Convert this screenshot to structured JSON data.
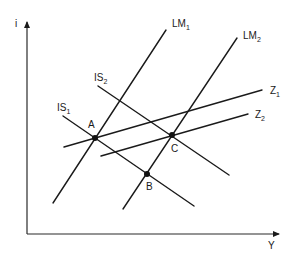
{
  "diagram": {
    "axes": {
      "y_label": "i",
      "x_label": "Y"
    },
    "curves": [
      {
        "id": "LM1",
        "label": "LM",
        "sub": "1",
        "x1": 53,
        "y1": 203,
        "x2": 166,
        "y2": 30,
        "lx": 172,
        "ly": 27
      },
      {
        "id": "LM2",
        "label": "LM",
        "sub": "2",
        "x1": 123,
        "y1": 209,
        "x2": 237,
        "y2": 38,
        "lx": 243,
        "ly": 39
      },
      {
        "id": "IS1",
        "label": "IS",
        "sub": "1",
        "x1": 63,
        "y1": 116,
        "x2": 194,
        "y2": 206,
        "lx": 57,
        "ly": 111
      },
      {
        "id": "IS2",
        "label": "IS",
        "sub": "2",
        "x1": 98,
        "y1": 86,
        "x2": 229,
        "y2": 175,
        "lx": 94,
        "ly": 81
      },
      {
        "id": "Z1",
        "label": "Z",
        "sub": "1",
        "x1": 64,
        "y1": 147,
        "x2": 262,
        "y2": 90,
        "lx": 270,
        "ly": 94
      },
      {
        "id": "Z2",
        "label": "Z",
        "sub": "2",
        "x1": 101,
        "y1": 156,
        "x2": 248,
        "y2": 114,
        "lx": 255,
        "ly": 118
      }
    ],
    "points": [
      {
        "id": "A",
        "label": "A",
        "x": 95,
        "y": 138,
        "lx": 88,
        "ly": 128
      },
      {
        "id": "B",
        "label": "B",
        "x": 147,
        "y": 174,
        "lx": 146,
        "ly": 190
      },
      {
        "id": "C",
        "label": "C",
        "x": 172,
        "y": 135,
        "lx": 171,
        "ly": 152
      }
    ]
  }
}
